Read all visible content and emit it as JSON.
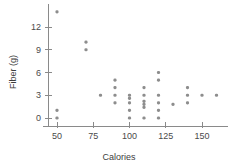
{
  "chart_data": {
    "type": "scatter",
    "title": "",
    "xlabel": "Calories",
    "ylabel": "Fiber (g)",
    "xlim": [
      40,
      168
    ],
    "ylim": [
      -1.2,
      15
    ],
    "grid": false,
    "legend": null,
    "marker_color": "#8d8d8d",
    "axis_color": "#8a8a8a",
    "xticks": [
      50,
      75,
      100,
      125,
      150
    ],
    "xtick_labels": [
      "50",
      "75",
      "100",
      "125",
      "150"
    ],
    "yticks": [
      0,
      3,
      6,
      9,
      12
    ],
    "ytick_labels": [
      "0",
      "3",
      "6",
      "9",
      "12"
    ],
    "points": [
      {
        "x": 50,
        "y": 14
      },
      {
        "x": 50,
        "y": 1
      },
      {
        "x": 50,
        "y": 0
      },
      {
        "x": 70,
        "y": 10
      },
      {
        "x": 70,
        "y": 9
      },
      {
        "x": 80,
        "y": 3
      },
      {
        "x": 90,
        "y": 5
      },
      {
        "x": 90,
        "y": 4
      },
      {
        "x": 90,
        "y": 3
      },
      {
        "x": 90,
        "y": 2
      },
      {
        "x": 100,
        "y": 3
      },
      {
        "x": 100,
        "y": 2.6
      },
      {
        "x": 100,
        "y": 2
      },
      {
        "x": 100,
        "y": 1
      },
      {
        "x": 100,
        "y": 0
      },
      {
        "x": 110,
        "y": 4
      },
      {
        "x": 110,
        "y": 3
      },
      {
        "x": 110,
        "y": 2.2
      },
      {
        "x": 110,
        "y": 1.8
      },
      {
        "x": 110,
        "y": 1.4
      },
      {
        "x": 110,
        "y": 0
      },
      {
        "x": 120,
        "y": 6
      },
      {
        "x": 120,
        "y": 5
      },
      {
        "x": 120,
        "y": 3
      },
      {
        "x": 120,
        "y": 2
      },
      {
        "x": 120,
        "y": 1
      },
      {
        "x": 120,
        "y": 0
      },
      {
        "x": 130,
        "y": 1.8
      },
      {
        "x": 140,
        "y": 4
      },
      {
        "x": 140,
        "y": 3
      },
      {
        "x": 140,
        "y": 2
      },
      {
        "x": 150,
        "y": 3
      },
      {
        "x": 160,
        "y": 3
      }
    ]
  }
}
